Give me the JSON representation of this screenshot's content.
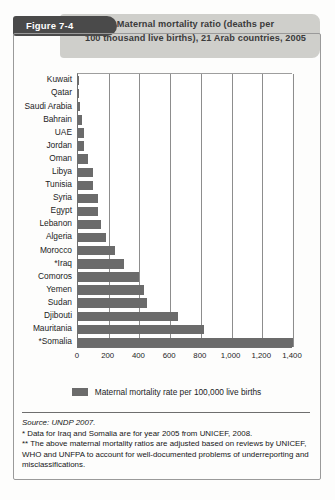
{
  "figure": {
    "tab_label": "Figure 7-4",
    "title": "Maternal mortality ratio (deaths per 100 thousand live births), 21 Arab countries, 2005",
    "title_line_1": "Maternal mortality ratio (deaths per",
    "title_line_2": "100 thousand live births), 21 Arab countries, 2005",
    "accent_dark": "#4a4a4a",
    "accent_band": "#cfcfcb",
    "bar_color": "#6b6b6b"
  },
  "legend": {
    "items": [
      {
        "label": "Maternal mortality rate per 100,000 live births",
        "color": "#6b6b6b"
      }
    ]
  },
  "footer": {
    "source": "Source: UNDP 2007.",
    "note_1": "* Data for Iraq and Somalia are for year 2005 from UNICEF, 2008.",
    "note_2": "** The above maternal mortality ratios are adjusted based on reviews by UNICEF, WHO and UNFPA to account for well-documented problems of underreporting and misclassifications."
  },
  "chart_data": {
    "type": "bar",
    "orientation": "horizontal",
    "title": "Maternal mortality ratio (deaths per 100 thousand live births), 21 Arab countries, 2005",
    "xlabel": "",
    "ylabel": "",
    "xlim": [
      0,
      1400
    ],
    "xticks": [
      0,
      200,
      400,
      600,
      800,
      1000,
      1200,
      1400
    ],
    "xticklabels": [
      "0",
      "200",
      "400",
      "600",
      "800",
      "1,000",
      "1,200",
      "1,400"
    ],
    "grid": "vertical",
    "legend_position": "bottom",
    "series_name": "Maternal mortality rate per 100,000 live births",
    "categories": [
      "Kuwait",
      "Qatar",
      "Saudi Arabia",
      "Bahrain",
      "UAE",
      "Jordan",
      "Oman",
      "Libya",
      "Tunisia",
      "Syria",
      "Egypt",
      "Lebanon",
      "Algeria",
      "Morocco",
      "*Iraq",
      "Comoros",
      "Yemen",
      "Sudan",
      "Djibouti",
      "Mauritania",
      "*Somalia"
    ],
    "values": [
      4,
      7,
      12,
      28,
      37,
      41,
      64,
      97,
      100,
      130,
      130,
      150,
      180,
      240,
      300,
      400,
      430,
      450,
      650,
      820,
      1400
    ]
  }
}
